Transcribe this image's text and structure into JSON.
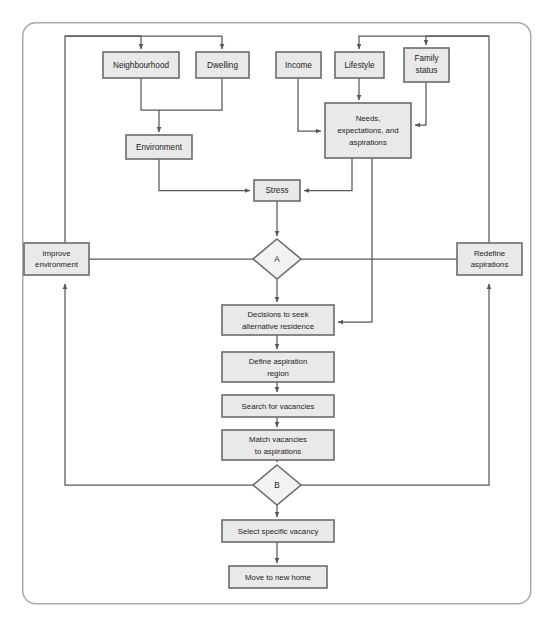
{
  "figure": {
    "type": "flowchart",
    "frame": {
      "x": 22,
      "y": 22,
      "width": 509,
      "height": 582,
      "radius": 13,
      "color": "#a9a9ab"
    },
    "colors": {
      "box_fill": "#e9e9e9",
      "diamond_fill": "#f2f2f2",
      "box_stroke": "#6b6b6b",
      "edge_stroke": "#58585a",
      "text": "#1c1c1c",
      "background": "#ffffff"
    }
  },
  "nodes": {
    "neighbourhood": {
      "label": "Neighbourhood",
      "shape": "rect",
      "x": 103,
      "y": 52,
      "w": 76,
      "h": 26
    },
    "dwelling": {
      "label": "Dwelling",
      "shape": "rect",
      "x": 196,
      "y": 52,
      "w": 53,
      "h": 26
    },
    "income": {
      "label": "Income",
      "shape": "rect",
      "x": 276,
      "y": 52,
      "w": 45,
      "h": 26
    },
    "lifestyle": {
      "label": "Lifestyle",
      "shape": "rect",
      "x": 335,
      "y": 52,
      "w": 49,
      "h": 26
    },
    "family_status": {
      "label": "Family\nstatus",
      "label_lines": [
        "Family",
        "status"
      ],
      "shape": "rect",
      "x": 404,
      "y": 48,
      "w": 45,
      "h": 34
    },
    "environment": {
      "label": "Environment",
      "shape": "rect",
      "x": 126,
      "y": 135,
      "w": 66,
      "h": 24
    },
    "needs": {
      "label": "Needs, expectations, and aspirations",
      "label_lines": [
        "Needs,",
        "expectations, and",
        "aspirations"
      ],
      "shape": "rect",
      "x": 325,
      "y": 103,
      "w": 86,
      "h": 55
    },
    "stress": {
      "label": "Stress",
      "shape": "rect",
      "x": 254,
      "y": 180,
      "w": 46,
      "h": 21
    },
    "improve_environment": {
      "label": "Improve environment",
      "label_lines": [
        "Improve",
        "environment"
      ],
      "shape": "rect",
      "x": 24,
      "y": 243,
      "w": 65,
      "h": 32
    },
    "redefine_aspirations": {
      "label": "Redefine aspirations",
      "label_lines": [
        "Redefine",
        "aspirations"
      ],
      "shape": "rect",
      "x": 457,
      "y": 243,
      "w": 65,
      "h": 32
    },
    "decision_a": {
      "label": "A",
      "shape": "diamond",
      "cx": 277,
      "cy": 259,
      "rx": 24,
      "ry": 20
    },
    "decisions_seek": {
      "label": "Decisions to seek alternative residence",
      "label_lines": [
        "Decisions to seek",
        "alternative residence"
      ],
      "shape": "rect",
      "x": 222,
      "y": 305,
      "w": 112,
      "h": 30
    },
    "define_region": {
      "label": "Define aspiration region",
      "label_lines": [
        "Define aspiration",
        "region"
      ],
      "shape": "rect",
      "x": 222,
      "y": 352,
      "w": 112,
      "h": 30
    },
    "search_vacancies": {
      "label": "Search for vacancies",
      "label_lines": [
        "Search for vacancies"
      ],
      "shape": "rect",
      "x": 222,
      "y": 395,
      "w": 112,
      "h": 22
    },
    "match_vacancies": {
      "label": "Match vacancies to aspirations",
      "label_lines": [
        "Match vacancies",
        "to aspirations"
      ],
      "shape": "rect",
      "x": 222,
      "y": 430,
      "w": 112,
      "h": 30
    },
    "decision_b": {
      "label": "B",
      "shape": "diamond",
      "cx": 277,
      "cy": 485,
      "rx": 24,
      "ry": 20
    },
    "select_vacancy": {
      "label": "Select specific vacancy",
      "label_lines": [
        "Select specific vacancy"
      ],
      "shape": "rect",
      "x": 222,
      "y": 520,
      "w": 112,
      "h": 22
    },
    "move_home": {
      "label": "Move to new home",
      "label_lines": [
        "Move to new home"
      ],
      "shape": "rect",
      "x": 229,
      "y": 566,
      "w": 98,
      "h": 22
    }
  },
  "edges": [
    {
      "id": "feedback-left-to-neighbourhood",
      "from": "improve_environment",
      "to": "neighbourhood",
      "points": "65,243 65,36 141,36 141,52",
      "arrow": "141,52"
    },
    {
      "id": "feedback-left-to-dwelling",
      "from": "improve_environment",
      "to": "dwelling",
      "points": "65,36 222,36 222,52",
      "arrow": "222,52"
    },
    {
      "id": "neighbourhood-to-environment",
      "from": "neighbourhood",
      "to": "environment",
      "points": "141,78 141,110 159,110 159,135",
      "arrow": "159,135"
    },
    {
      "id": "dwelling-to-environment",
      "from": "dwelling",
      "to": "environment",
      "points": "222,78 222,110 159,110",
      "arrow": "none"
    },
    {
      "id": "environment-to-stress",
      "from": "environment",
      "to": "stress",
      "points": "159,159 159,190 254,190",
      "arrow": "254,190"
    },
    {
      "id": "feedback-right-to-lifestyle",
      "from": "redefine_aspirations",
      "to": "lifestyle",
      "points": "489,243 489,36 359,36 359,52",
      "arrow": "359,52"
    },
    {
      "id": "feedback-right-to-family-status",
      "from": "redefine_aspirations",
      "to": "family_status",
      "points": "489,36 426,36 426,48",
      "arrow": "426,48"
    },
    {
      "id": "income-to-needs",
      "from": "income",
      "to": "needs",
      "points": "298,78 298,131 325,131",
      "arrow": "325,131"
    },
    {
      "id": "lifestyle-to-needs",
      "from": "lifestyle",
      "to": "needs",
      "points": "359,78 359,103",
      "arrow": "359,103"
    },
    {
      "id": "family-status-to-needs",
      "from": "family_status",
      "to": "needs",
      "points": "426,82 426,125 411,125",
      "arrow": "411,125"
    },
    {
      "id": "needs-to-stress",
      "from": "needs",
      "to": "stress",
      "points": "352,158 352,190 300,190",
      "arrow": "300,190"
    },
    {
      "id": "stress-to-a",
      "from": "stress",
      "to": "decision_a",
      "points": "277,201 277,239",
      "arrow": "277,239"
    },
    {
      "id": "a-to-improve-environment",
      "from": "decision_a",
      "to": "improve_environment",
      "points": "253,259 89,259",
      "arrow": "none"
    },
    {
      "id": "a-to-redefine-aspirations",
      "from": "decision_a",
      "to": "redefine_aspirations",
      "points": "301,259 457,259",
      "arrow": "none"
    },
    {
      "id": "a-to-decisions-seek",
      "from": "decision_a",
      "to": "decisions_seek",
      "points": "277,279 277,305",
      "arrow": "277,305"
    },
    {
      "id": "needs-to-decisions-seek",
      "from": "needs",
      "to": "decisions_seek",
      "points": "372,158 372,322 334,322",
      "arrow": "334,322"
    },
    {
      "id": "decisions-seek-to-define-region",
      "from": "decisions_seek",
      "to": "define_region",
      "points": "277,335 277,352",
      "arrow": "277,352"
    },
    {
      "id": "define-region-to-search",
      "from": "define_region",
      "to": "search_vacancies",
      "points": "277,382 277,395",
      "arrow": "277,395"
    },
    {
      "id": "search-to-match",
      "from": "search_vacancies",
      "to": "match_vacancies",
      "points": "277,417 277,430",
      "arrow": "277,430"
    },
    {
      "id": "match-to-b",
      "from": "match_vacancies",
      "to": "decision_b",
      "points": "277,460 277,465",
      "arrow": "277,465"
    },
    {
      "id": "b-to-improve-environment",
      "from": "decision_b",
      "to": "improve_environment",
      "points": "253,485 65,485 65,281",
      "arrow": "65,281"
    },
    {
      "id": "b-to-redefine-aspirations",
      "from": "decision_b",
      "to": "redefine_aspirations",
      "points": "301,485 489,485 489,281",
      "arrow": "489,281"
    },
    {
      "id": "b-to-select-vacancy",
      "from": "decision_b",
      "to": "select_vacancy",
      "points": "277,505 277,520",
      "arrow": "277,520"
    },
    {
      "id": "select-vacancy-to-move-home",
      "from": "select_vacancy",
      "to": "move_home",
      "points": "277,542 277,566",
      "arrow": "277,566"
    }
  ]
}
